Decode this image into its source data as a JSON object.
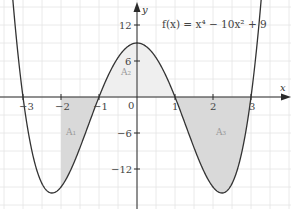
{
  "chart_data": {
    "type": "line",
    "title": "",
    "function_label": "f(x) = x⁴ − 10x² + 9",
    "function": "x^4 - 10x^2 + 9",
    "xlabel": "x",
    "ylabel": "y",
    "xlim": [
      -3.6,
      4.0
    ],
    "ylim": [
      -17,
      16
    ],
    "grid": true,
    "grid_spacing": {
      "x": 0.5,
      "y": 3
    },
    "x_ticks": [
      -3,
      -2,
      -1,
      0,
      1,
      2,
      3
    ],
    "x_tick_labels": [
      "−3",
      "−2",
      "−1",
      "0",
      "1",
      "2",
      "3"
    ],
    "y_ticks": [
      12,
      6,
      -6,
      -12
    ],
    "y_tick_labels": [
      "12",
      "6",
      "−6",
      "−12"
    ],
    "roots": [
      -3,
      -1,
      1,
      3
    ],
    "key_points": [
      {
        "x": -2.236,
        "y": -16,
        "label": "local minimum"
      },
      {
        "x": 0,
        "y": 9,
        "label": "local maximum"
      },
      {
        "x": 2.236,
        "y": -16,
        "label": "local minimum"
      }
    ],
    "shaded_regions": [
      {
        "name": "A1",
        "label": "A₁",
        "x_from": -2,
        "x_to": -1,
        "fill": "#d9d9d9"
      },
      {
        "name": "A2",
        "label": "A₂",
        "x_from": -1,
        "x_to": 1,
        "fill": "#efefef"
      },
      {
        "name": "A3",
        "label": "A₃",
        "x_from": 1,
        "x_to": 3,
        "fill": "#d9d9d9"
      }
    ],
    "legend": "none"
  },
  "labels": {
    "formula": "f(x) = x⁴ − 10x² + 9",
    "x_axis": "x",
    "y_axis": "y",
    "a1": "A₁",
    "a2": "A₂",
    "a3": "A₃",
    "xt_m3": "−3",
    "xt_m2": "−2",
    "xt_m1": "−1",
    "xt_0": "0",
    "xt_1": "1",
    "xt_2": "2",
    "xt_3": "3",
    "yt_12": "12",
    "yt_6": "6",
    "yt_m6": "−6",
    "yt_m12": "−12"
  },
  "colors": {
    "curve": "#333333",
    "axis": "#2a2a2a",
    "grid": "#e4e4e4",
    "dark_shade": "#d9d9d9",
    "light_shade": "#efefef"
  }
}
